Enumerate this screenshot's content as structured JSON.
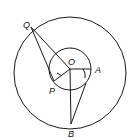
{
  "diagram": {
    "type": "geometry",
    "stroke_color": "#1a1a1a",
    "labels": {
      "Q": "Q",
      "O": "O",
      "A": "A",
      "P": "P",
      "B": "B"
    },
    "points": {
      "Q": [
        31,
        27
      ],
      "O": [
        70,
        69
      ],
      "A": [
        91,
        69
      ],
      "P": [
        54,
        81
      ],
      "B": [
        71,
        124
      ]
    },
    "circles": [
      {
        "name": "outer-circle",
        "center": [
          70,
          73
        ],
        "radius": 56
      },
      {
        "name": "inner-circle",
        "center": [
          70,
          69
        ],
        "radius": 21
      }
    ]
  }
}
